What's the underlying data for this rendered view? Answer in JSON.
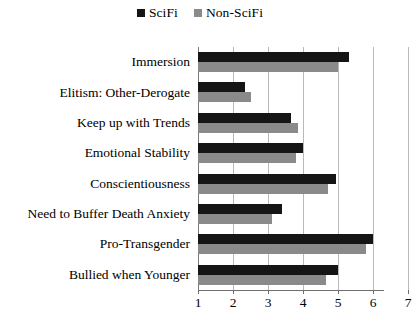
{
  "legend": {
    "position": "top-center",
    "entries": [
      {
        "label": "SciFi",
        "color": "#151515",
        "icon": "legend-square-icon"
      },
      {
        "label": "Non-SciFi",
        "color": "#8a8a8a",
        "icon": "legend-square-icon"
      }
    ]
  },
  "axis": {
    "x_ticks": [
      "1",
      "2",
      "3",
      "4",
      "5",
      "6",
      "7"
    ]
  },
  "chart_data": {
    "type": "bar",
    "orientation": "horizontal",
    "title": "",
    "subtitle": "",
    "xlabel": "",
    "ylabel": "",
    "xlim": [
      1,
      7
    ],
    "ylim": null,
    "grid": true,
    "grid_axis": "x",
    "legend_position": "top-center",
    "xticks": [
      1,
      2,
      3,
      4,
      5,
      6,
      7
    ],
    "categories": [
      "Immersion",
      "Elitism: Other-Derogate",
      "Keep up with Trends",
      "Emotional Stability",
      "Conscientiousness",
      "Need to Buffer Death Anxiety",
      "Pro-Transgender",
      "Bullied when Younger"
    ],
    "series": [
      {
        "name": "SciFi",
        "color": "#151515",
        "values": [
          5.3,
          2.35,
          3.65,
          4.0,
          4.95,
          3.4,
          6.0,
          5.0
        ]
      },
      {
        "name": "Non-SciFi",
        "color": "#8a8a8a",
        "values": [
          5.0,
          2.5,
          3.85,
          3.8,
          4.7,
          3.1,
          5.8,
          4.65
        ]
      }
    ]
  }
}
